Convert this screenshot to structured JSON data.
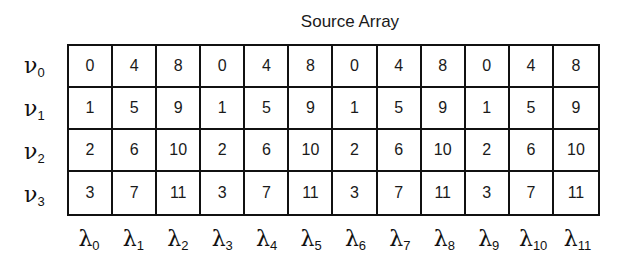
{
  "title": "Source Array",
  "row_labels": [
    {
      "symbol": "ν",
      "sub": "0"
    },
    {
      "symbol": "ν",
      "sub": "1"
    },
    {
      "symbol": "ν",
      "sub": "2"
    },
    {
      "symbol": "ν",
      "sub": "3"
    }
  ],
  "column_labels": [
    {
      "symbol": "λ",
      "sub": "0"
    },
    {
      "symbol": "λ",
      "sub": "1"
    },
    {
      "symbol": "λ",
      "sub": "2"
    },
    {
      "symbol": "λ",
      "sub": "3"
    },
    {
      "symbol": "λ",
      "sub": "4"
    },
    {
      "symbol": "λ",
      "sub": "5"
    },
    {
      "symbol": "λ",
      "sub": "6"
    },
    {
      "symbol": "λ",
      "sub": "7"
    },
    {
      "symbol": "λ",
      "sub": "8"
    },
    {
      "symbol": "λ",
      "sub": "9"
    },
    {
      "symbol": "λ",
      "sub": "10"
    },
    {
      "symbol": "λ",
      "sub": "11"
    }
  ],
  "rows": [
    [
      "0",
      "4",
      "8",
      "0",
      "4",
      "8",
      "0",
      "4",
      "8",
      "0",
      "4",
      "8"
    ],
    [
      "1",
      "5",
      "9",
      "1",
      "5",
      "9",
      "1",
      "5",
      "9",
      "1",
      "5",
      "9"
    ],
    [
      "2",
      "6",
      "10",
      "2",
      "6",
      "10",
      "2",
      "6",
      "10",
      "2",
      "6",
      "10"
    ],
    [
      "3",
      "7",
      "11",
      "3",
      "7",
      "11",
      "3",
      "7",
      "11",
      "3",
      "7",
      "11"
    ]
  ]
}
